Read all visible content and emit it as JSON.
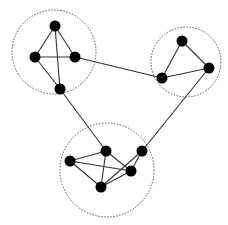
{
  "diagram": {
    "type": "clustered-graph",
    "width": 228,
    "height": 225,
    "colors": {
      "background": "#ffffff",
      "node": "#000000",
      "edge": "#333333",
      "cluster_border": "#555555"
    },
    "clusters": [
      {
        "id": "cluster-top-left",
        "cx": 54,
        "cy": 52,
        "r": 42
      },
      {
        "id": "cluster-top-right",
        "cx": 186,
        "cy": 62,
        "r": 35
      },
      {
        "id": "cluster-bottom",
        "cx": 107,
        "cy": 170,
        "r": 47
      }
    ],
    "nodes": [
      {
        "id": "A",
        "cluster": "cluster-top-left",
        "x": 55,
        "y": 26
      },
      {
        "id": "B",
        "cluster": "cluster-top-left",
        "x": 35,
        "y": 57
      },
      {
        "id": "C",
        "cluster": "cluster-top-left",
        "x": 75,
        "y": 57
      },
      {
        "id": "D",
        "cluster": "cluster-top-left",
        "x": 60,
        "y": 89
      },
      {
        "id": "E",
        "cluster": "cluster-top-right",
        "x": 182,
        "y": 41
      },
      {
        "id": "F",
        "cluster": "cluster-top-right",
        "x": 162,
        "y": 78
      },
      {
        "id": "G",
        "cluster": "cluster-top-right",
        "x": 209,
        "y": 68
      },
      {
        "id": "H",
        "cluster": "cluster-bottom",
        "x": 106,
        "y": 151
      },
      {
        "id": "I",
        "cluster": "cluster-bottom",
        "x": 70,
        "y": 161
      },
      {
        "id": "J",
        "cluster": "cluster-bottom",
        "x": 101,
        "y": 187
      },
      {
        "id": "K",
        "cluster": "cluster-bottom",
        "x": 131,
        "y": 171
      },
      {
        "id": "L",
        "cluster": "cluster-bottom",
        "x": 142,
        "y": 151
      }
    ],
    "edges": [
      [
        "A",
        "B"
      ],
      [
        "A",
        "C"
      ],
      [
        "A",
        "D"
      ],
      [
        "B",
        "C"
      ],
      [
        "B",
        "D"
      ],
      [
        "E",
        "F"
      ],
      [
        "E",
        "G"
      ],
      [
        "F",
        "G"
      ],
      [
        "H",
        "I"
      ],
      [
        "H",
        "J"
      ],
      [
        "H",
        "K"
      ],
      [
        "I",
        "J"
      ],
      [
        "I",
        "K"
      ],
      [
        "J",
        "K"
      ],
      [
        "J",
        "L"
      ],
      [
        "K",
        "L"
      ],
      [
        "C",
        "F"
      ],
      [
        "D",
        "H"
      ],
      [
        "G",
        "L"
      ]
    ],
    "node_radius": 5.5
  }
}
